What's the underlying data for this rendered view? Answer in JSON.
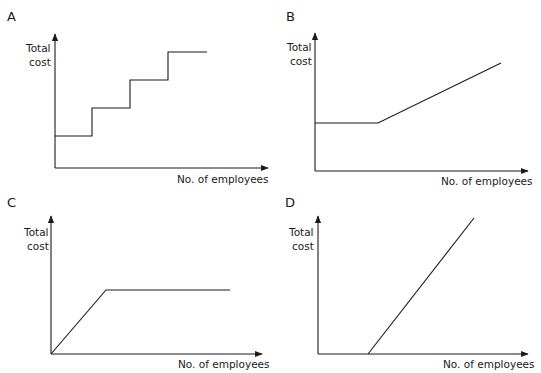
{
  "panels": [
    {
      "label": "A",
      "y_label_1": "Total",
      "y_label_2": "cost",
      "x_label": "No. of employees",
      "shape": "step"
    },
    {
      "label": "B",
      "y_label_1": "Total",
      "y_label_2": "cost",
      "x_label": "No. of employees",
      "shape": "flat-then-rising"
    },
    {
      "label": "C",
      "y_label_1": "Total",
      "y_label_2": "cost",
      "x_label": "No. of employees",
      "shape": "rising-then-flat"
    },
    {
      "label": "D",
      "y_label_1": "Total",
      "y_label_2": "cost",
      "x_label": "No. of employees",
      "shape": "rising-from-offset"
    }
  ],
  "colors": {
    "line": "#1a1a1a",
    "background": "#ffffff"
  }
}
